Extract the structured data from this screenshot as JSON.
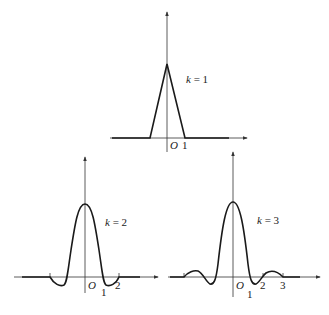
{
  "diagram": {
    "stroke_color": "#1a1a1a",
    "axis_color": "#333333",
    "panels": [
      {
        "id": "k1",
        "label": "k = 1",
        "label_k": "k",
        "label_eq": "= 1",
        "origin_label": "O",
        "ticks": [
          {
            "value": 1,
            "label": "1"
          }
        ],
        "shape": "triangle",
        "support": [
          -1,
          1
        ]
      },
      {
        "id": "k2",
        "label": "k = 2",
        "label_k": "k",
        "label_eq": "= 2",
        "origin_label": "O",
        "ticks": [
          {
            "value": 1,
            "label": "1"
          },
          {
            "value": 2,
            "label": "2"
          }
        ],
        "shape": "oscillating",
        "support": [
          -2,
          2
        ]
      },
      {
        "id": "k3",
        "label": "k = 3",
        "label_k": "k",
        "label_eq": "= 3",
        "origin_label": "O",
        "ticks": [
          {
            "value": 1,
            "label": "1"
          },
          {
            "value": 2,
            "label": "2"
          },
          {
            "value": 3,
            "label": "3"
          }
        ],
        "shape": "oscillating",
        "support": [
          -3,
          3
        ]
      }
    ]
  }
}
